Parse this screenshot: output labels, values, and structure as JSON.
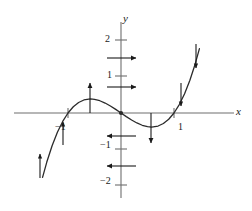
{
  "figure": {
    "name": "cubic-function-slope-field-graph",
    "background": "#ffffff",
    "curve_color": "#2b2b2b",
    "axis_color": "#6e6e6e",
    "arrow_color": "#1a1a1a",
    "width": 252,
    "height": 211
  },
  "axes": {
    "x_label": "x",
    "y_label": "y",
    "origin_marker": "filled-dot"
  },
  "tick_labels": {
    "y_2": "2",
    "y_1": "1",
    "y_neg1": "−1",
    "y_neg2": "−2",
    "x_neg1": "−1",
    "x_1": "1"
  },
  "chart_data": {
    "type": "line",
    "title": "",
    "xlabel": "x",
    "ylabel": "y",
    "grid": false,
    "legend": null,
    "xlim": [
      -1.55,
      1.55
    ],
    "ylim": [
      -2.45,
      2.45
    ],
    "x_ticks": [
      -1,
      1
    ],
    "x_tick_labels": [
      "−1",
      "1"
    ],
    "y_ticks": [
      -2,
      -1,
      1,
      2
    ],
    "y_tick_labels": [
      "−2",
      "−1",
      "1",
      "2"
    ],
    "series": [
      {
        "name": "y = x^3 - x",
        "expression": "x^3 - x",
        "color": "#2b2b2b",
        "roots": [
          -1,
          0,
          1
        ],
        "local_max": {
          "x": -0.577,
          "y": 0.385
        },
        "local_min": {
          "x": 0.577,
          "y": -0.385
        },
        "x": [
          -1.48,
          -1.4,
          -1.3,
          -1.2,
          -1.1,
          -1.0,
          -0.9,
          -0.8,
          -0.7,
          -0.577,
          -0.5,
          -0.4,
          -0.3,
          -0.2,
          -0.1,
          0.0,
          0.1,
          0.2,
          0.3,
          0.4,
          0.5,
          0.577,
          0.7,
          0.8,
          0.9,
          1.0,
          1.1,
          1.2,
          1.3,
          1.4,
          1.48
        ],
        "y": [
          -1.763,
          -1.344,
          -0.897,
          -0.528,
          -0.231,
          0.0,
          0.171,
          0.288,
          0.357,
          0.385,
          0.375,
          0.336,
          0.273,
          0.192,
          0.099,
          0.0,
          -0.099,
          -0.192,
          -0.273,
          -0.336,
          -0.375,
          -0.385,
          -0.357,
          -0.288,
          -0.171,
          0.0,
          0.231,
          0.528,
          0.897,
          1.344,
          1.763
        ]
      }
    ],
    "annotations": [
      {
        "kind": "arrow",
        "direction": "up",
        "at": {
          "x": -0.577,
          "y": 0.385
        },
        "note": "vertical up arrow at local maximum"
      },
      {
        "kind": "arrow",
        "direction": "down",
        "at": {
          "x": 0.577,
          "y": -0.385
        },
        "note": "vertical down arrow at local minimum"
      },
      {
        "kind": "arrow",
        "direction": "right",
        "at": {
          "x": 0.0,
          "y": 1.52
        },
        "note": "horizontal right arrow on y-axis above 1"
      },
      {
        "kind": "arrow",
        "direction": "right",
        "at": {
          "x": 0.0,
          "y": 0.72
        },
        "note": "horizontal right arrow on y-axis below 1"
      },
      {
        "kind": "arrow",
        "direction": "left",
        "at": {
          "x": 0.0,
          "y": -0.62
        },
        "note": "horizontal left arrow on y-axis above -1"
      },
      {
        "kind": "arrow",
        "direction": "left",
        "at": {
          "x": 0.0,
          "y": -1.42
        },
        "note": "horizontal left arrow on y-axis below -1"
      },
      {
        "kind": "arrow",
        "direction": "up-along-curve",
        "at": {
          "x": -1.27,
          "y": -0.78
        },
        "note": "arrow along lower-left branch"
      },
      {
        "kind": "arrow",
        "direction": "up-along-curve",
        "at": {
          "x": -1.02,
          "y": -0.05
        },
        "note": "arrow near x = -1 crossing"
      },
      {
        "kind": "arrow",
        "direction": "down-along-curve",
        "at": {
          "x": 1.06,
          "y": 0.12
        },
        "note": "arrow near x = 1 crossing"
      },
      {
        "kind": "arrow",
        "direction": "down-along-curve",
        "at": {
          "x": 1.3,
          "y": 0.9
        },
        "note": "arrow on rising right branch"
      }
    ]
  }
}
